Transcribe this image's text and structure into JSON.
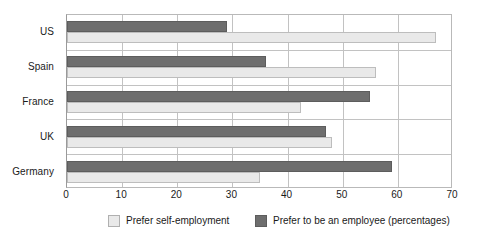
{
  "chart_data": {
    "type": "bar",
    "orientation": "horizontal",
    "title": "",
    "xlabel": "",
    "ylabel": "",
    "xlim": [
      0,
      70
    ],
    "xticks": [
      0,
      10,
      20,
      30,
      40,
      50,
      60,
      70
    ],
    "grid": true,
    "legend_position": "bottom",
    "categories": [
      "US",
      "Spain",
      "France",
      "UK",
      "Germany"
    ],
    "series": [
      {
        "name": "Prefer self-employment",
        "color": "#e9e9e9",
        "values": [
          67,
          56,
          42.5,
          48,
          35
        ]
      },
      {
        "name": "Prefer to be an employee (percentages)",
        "color": "#6e6e6e",
        "values": [
          29,
          36,
          55,
          47,
          59
        ]
      }
    ]
  },
  "legend": {
    "items": [
      {
        "label": "Prefer self-employment",
        "swatch": "light"
      },
      {
        "label": "Prefer to be an employee (percentages)",
        "swatch": "dark"
      }
    ]
  }
}
